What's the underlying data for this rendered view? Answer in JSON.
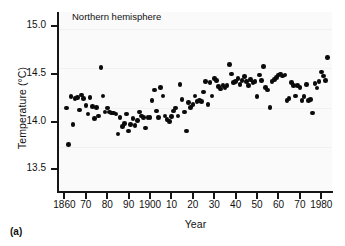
{
  "figure": {
    "panel_tag": "(a)",
    "annotation": "Northern hemisphere"
  },
  "chart_data": {
    "type": "scatter",
    "title": "Northern hemisphere",
    "xlabel": "Year",
    "ylabel": "Temperature (°C)",
    "xlim": [
      1857,
      1985
    ],
    "ylim": [
      13.26,
      15.15
    ],
    "grid": true,
    "legend": null,
    "xticks": [
      1860,
      1870,
      1880,
      1890,
      1900,
      1910,
      1920,
      1930,
      1940,
      1950,
      1960,
      1970,
      1980
    ],
    "xticklabels": [
      "1860",
      "70",
      "80",
      "90",
      "1900",
      "10",
      "20",
      "30",
      "40",
      "50",
      "60",
      "70",
      "1980"
    ],
    "yticks": [
      13.5,
      14.0,
      14.5,
      15.0
    ],
    "yticklabels": [
      "13.5",
      "14.0",
      "14.5",
      "15.0"
    ],
    "marker": "filled-circle",
    "marker_color": "#0b0b0b",
    "series": [
      {
        "name": "Northern hemisphere mean temperature",
        "x": [
          1861,
          1862,
          1863,
          1864,
          1865,
          1866,
          1867,
          1868,
          1869,
          1870,
          1871,
          1872,
          1873,
          1874,
          1875,
          1876,
          1877,
          1878,
          1879,
          1880,
          1881,
          1882,
          1883,
          1884,
          1885,
          1886,
          1887,
          1888,
          1889,
          1890,
          1891,
          1892,
          1893,
          1894,
          1895,
          1896,
          1897,
          1898,
          1899,
          1900,
          1901,
          1902,
          1903,
          1904,
          1905,
          1906,
          1907,
          1908,
          1909,
          1910,
          1911,
          1912,
          1913,
          1914,
          1915,
          1916,
          1917,
          1918,
          1919,
          1920,
          1921,
          1922,
          1923,
          1924,
          1925,
          1926,
          1927,
          1928,
          1929,
          1930,
          1931,
          1932,
          1933,
          1934,
          1935,
          1936,
          1937,
          1938,
          1939,
          1940,
          1941,
          1942,
          1943,
          1944,
          1945,
          1946,
          1947,
          1948,
          1949,
          1950,
          1951,
          1952,
          1953,
          1954,
          1955,
          1956,
          1957,
          1958,
          1959,
          1960,
          1961,
          1962,
          1963,
          1964,
          1965,
          1966,
          1967,
          1968,
          1969,
          1970,
          1971,
          1972,
          1973,
          1974,
          1975,
          1976,
          1977,
          1978,
          1979,
          1980,
          1981,
          1982,
          1983
        ],
        "y": [
          14.14,
          13.76,
          14.26,
          13.97,
          14.24,
          14.25,
          14.12,
          14.28,
          14.24,
          14.17,
          14.08,
          14.25,
          14.16,
          14.03,
          14.15,
          14.06,
          14.57,
          14.27,
          14.1,
          14.14,
          14.1,
          14.09,
          14.09,
          14.08,
          13.87,
          14.04,
          13.95,
          13.98,
          14.08,
          13.9,
          13.97,
          14.03,
          13.96,
          14.01,
          14.1,
          14.06,
          14.04,
          13.93,
          14.04,
          14.04,
          14.22,
          14.33,
          14.11,
          14.04,
          14.36,
          14.27,
          14.06,
          14.02,
          14.0,
          14.05,
          14.11,
          14.14,
          14.06,
          14.39,
          14.23,
          14.1,
          13.9,
          14.2,
          14.15,
          14.18,
          14.27,
          14.21,
          14.22,
          14.21,
          14.31,
          14.42,
          14.18,
          14.41,
          14.27,
          14.45,
          14.43,
          14.37,
          14.34,
          14.38,
          14.35,
          14.38,
          14.6,
          14.5,
          14.41,
          14.42,
          14.45,
          14.39,
          14.43,
          14.47,
          14.42,
          14.38,
          14.44,
          14.41,
          14.42,
          14.26,
          14.49,
          14.43,
          14.58,
          14.36,
          14.33,
          14.15,
          14.42,
          14.44,
          14.46,
          14.49,
          14.5,
          14.48,
          14.49,
          14.22,
          14.24,
          14.41,
          14.38,
          14.27,
          14.38,
          14.36,
          14.22,
          14.26,
          14.39,
          14.22,
          14.23,
          14.09,
          14.4,
          14.35,
          14.42,
          14.52,
          14.48,
          14.43,
          14.67
        ]
      }
    ]
  }
}
